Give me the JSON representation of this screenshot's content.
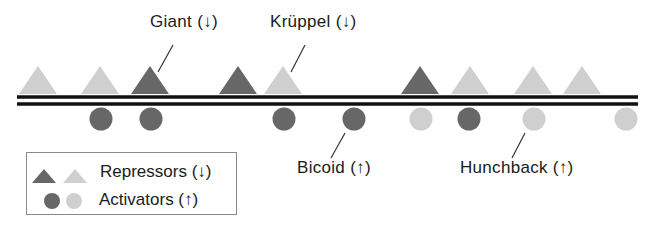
{
  "colors": {
    "dark": "#676767",
    "light": "#cfcfcf",
    "dna": "#111111",
    "leader": "#333333"
  },
  "dna": {
    "x1": 17,
    "x2": 638,
    "top_y": 97,
    "bottom_y": 104,
    "thickness": 3.5
  },
  "repressors": [
    {
      "x": 38,
      "shade": "light"
    },
    {
      "x": 100,
      "shade": "light"
    },
    {
      "x": 150,
      "shade": "dark"
    },
    {
      "x": 238,
      "shade": "dark"
    },
    {
      "x": 283,
      "shade": "light"
    },
    {
      "x": 420,
      "shade": "dark"
    },
    {
      "x": 470,
      "shade": "light"
    },
    {
      "x": 533,
      "shade": "light"
    },
    {
      "x": 582,
      "shade": "light"
    }
  ],
  "activators": [
    {
      "x": 101,
      "shade": "dark"
    },
    {
      "x": 151,
      "shade": "dark"
    },
    {
      "x": 284,
      "shade": "dark"
    },
    {
      "x": 354,
      "shade": "dark"
    },
    {
      "x": 421,
      "shade": "light"
    },
    {
      "x": 469,
      "shade": "dark"
    },
    {
      "x": 534,
      "shade": "light"
    },
    {
      "x": 626,
      "shade": "light"
    }
  ],
  "labels": {
    "giant": {
      "name": "Giant",
      "arrow": "↓",
      "x": 150,
      "y": 12
    },
    "kruppel": {
      "name": "Krüppel",
      "arrow": "↓",
      "x": 270,
      "y": 12
    },
    "bicoid": {
      "name": "Bicoid",
      "arrow": "↑",
      "x": 297,
      "y": 158
    },
    "hunchback": {
      "name": "Hunchback",
      "arrow": "↑",
      "x": 460,
      "y": 158
    }
  },
  "leaders": [
    {
      "x1": 173,
      "y1": 45,
      "x2": 158,
      "y2": 72
    },
    {
      "x1": 305,
      "y1": 45,
      "x2": 291,
      "y2": 72
    },
    {
      "x1": 345,
      "y1": 133,
      "x2": 331,
      "y2": 158
    },
    {
      "x1": 525,
      "y1": 133,
      "x2": 512,
      "y2": 158
    }
  ],
  "legend": {
    "repressors_label": "Repressors",
    "repressors_arrow": "↓",
    "activators_label": "Activators",
    "activators_arrow": "↑"
  }
}
